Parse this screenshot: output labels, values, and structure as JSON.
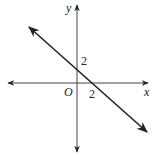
{
  "diagram": {
    "type": "coordinate-plane-line",
    "axes": {
      "x_label": "x",
      "y_label": "y",
      "origin_label": "O"
    },
    "line": {
      "description": "Straight line with arrows at both ends, negative slope",
      "y_intercept_label": "2",
      "x_intercept_label": "2",
      "y_intercept": [
        0,
        2
      ],
      "x_intercept": [
        2,
        0
      ],
      "slope": -1,
      "equation": "y = -x + 2"
    },
    "colors": {
      "stroke": "#222222",
      "background": "#ffffff"
    }
  }
}
